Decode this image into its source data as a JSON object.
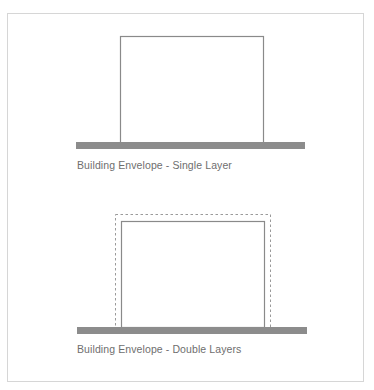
{
  "figure": {
    "panels": [
      {
        "caption": "Building Envelope - Single Layer",
        "layers": 1
      },
      {
        "caption": "Building Envelope - Double Layers",
        "layers": 2
      }
    ]
  },
  "colors": {
    "frame_border": "#d6d6d6",
    "wall_stroke": "#8a8a8a",
    "ground_fill": "#8c8c8c",
    "dashed_stroke": "#9a9a9a",
    "caption_text": "#6e6e6e"
  }
}
